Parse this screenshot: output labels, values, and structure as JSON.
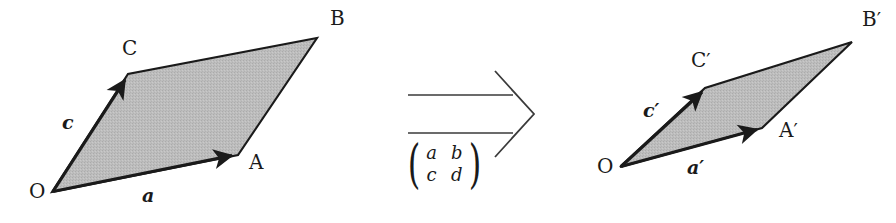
{
  "figure": {
    "type": "linear-transformation-diagram",
    "background_color": "#ffffff",
    "stroke_color": "#1a1a1a",
    "fill_color": "#b9b9b9"
  },
  "source_shape": {
    "name": "parallelogram-OABC",
    "vertices": {
      "O": {
        "x": 52,
        "y": 192,
        "label": "O",
        "label_x": 29,
        "label_y": 194
      },
      "A": {
        "x": 238,
        "y": 155,
        "label": "A",
        "label_x": 249,
        "label_y": 163
      },
      "B": {
        "x": 317,
        "y": 38,
        "label": "B",
        "label_x": 330,
        "label_y": 12
      },
      "C": {
        "x": 128,
        "y": 74,
        "label": "C",
        "label_x": 123,
        "label_y": 42
      }
    },
    "vectors": [
      {
        "name": "a",
        "label": "a",
        "prime": "",
        "label_x": 143,
        "label_y": 192,
        "from": "O",
        "to": "A"
      },
      {
        "name": "c",
        "label": "c",
        "prime": "",
        "label_x": 62,
        "label_y": 118,
        "from": "O",
        "to": "C"
      }
    ]
  },
  "target_shape": {
    "name": "parallelogram-OA-B-C-prime",
    "vertices": {
      "O": {
        "x": 620,
        "y": 167,
        "label": "O",
        "label_x": 597,
        "label_y": 170
      },
      "A": {
        "x": 762,
        "y": 128,
        "label": "A",
        "prime": "′",
        "label_x": 779,
        "label_y": 131
      },
      "B": {
        "x": 852,
        "y": 42,
        "label": "B",
        "prime": "′",
        "label_x": 862,
        "label_y": 14
      },
      "C": {
        "x": 705,
        "y": 88,
        "label": "C",
        "prime": "′",
        "label_x": 692,
        "label_y": 54
      }
    },
    "vectors": [
      {
        "name": "a-prime",
        "label": "a",
        "prime": "′",
        "label_x": 688,
        "label_y": 164,
        "from": "O",
        "to": "A"
      },
      {
        "name": "c-prime",
        "label": "c",
        "prime": "′",
        "label_x": 644,
        "label_y": 106,
        "from": "O",
        "to": "C"
      }
    ]
  },
  "transformation_arrow": {
    "name": "double-line-right-arrow",
    "top_line_y": 95,
    "bottom_line_y": 133,
    "x_start": 408,
    "x_end": 512,
    "tip_x": 534,
    "tip_y": 114
  },
  "matrix": {
    "name": "transformation-matrix",
    "rows": [
      [
        "a",
        "b"
      ],
      [
        "c",
        "d"
      ]
    ],
    "left_paren": "(",
    "right_paren": ")"
  }
}
